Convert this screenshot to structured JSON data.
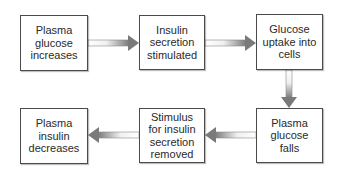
{
  "diagram": {
    "type": "flowchart",
    "nodes": [
      {
        "id": "n1",
        "label": "Plasma\nglucose\nincreases"
      },
      {
        "id": "n2",
        "label": "Insulin\nsecretion\nstimulated"
      },
      {
        "id": "n3",
        "label": "Glucose\nuptake into\ncells"
      },
      {
        "id": "n4",
        "label": "Plasma\nglucose\nfalls"
      },
      {
        "id": "n5",
        "label": "Stimulus\nfor insulin\nsecretion\nremoved"
      },
      {
        "id": "n6",
        "label": "Plasma\ninsulin\ndecreases"
      }
    ],
    "edges": [
      {
        "from": "n1",
        "to": "n2",
        "direction": "right"
      },
      {
        "from": "n2",
        "to": "n3",
        "direction": "right"
      },
      {
        "from": "n3",
        "to": "n4",
        "direction": "down"
      },
      {
        "from": "n4",
        "to": "n5",
        "direction": "left"
      },
      {
        "from": "n5",
        "to": "n6",
        "direction": "left"
      }
    ],
    "colors": {
      "box_border": "#4a4a4a",
      "arrow_dark": "#7a7a7a",
      "arrow_light": "#ffffff",
      "text": "#2a2a2a"
    }
  }
}
